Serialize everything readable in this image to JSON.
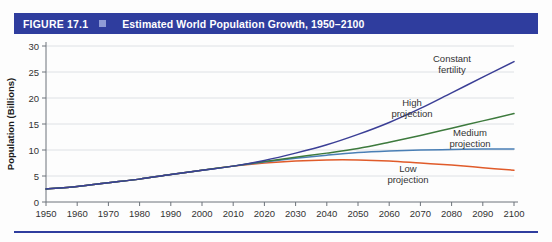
{
  "figure": {
    "number": "FIGURE 17.1",
    "marker_icon": "square-bullet-icon",
    "title": "Estimated World Population Growth, 1950–2100",
    "accent_color": "#2f3d9e"
  },
  "chart_data": {
    "type": "line",
    "title": "Estimated World Population Growth, 1950–2100",
    "xlabel": "",
    "ylabel": "Population (Billions)",
    "xlim": [
      1950,
      2100
    ],
    "ylim": [
      0,
      30
    ],
    "grid": true,
    "legend_position": "inline-annotations",
    "xticks": [
      1950,
      1960,
      1970,
      1980,
      1990,
      2000,
      2010,
      2020,
      2030,
      2040,
      2050,
      2060,
      2070,
      2080,
      2090,
      2100
    ],
    "yticks": [
      0,
      5,
      10,
      15,
      20,
      25,
      30
    ],
    "x": [
      1950,
      1960,
      1970,
      1980,
      1990,
      2000,
      2010,
      2020,
      2030,
      2040,
      2050,
      2060,
      2070,
      2080,
      2090,
      2100
    ],
    "series": [
      {
        "name": "Constant fertility",
        "color": "#3b3f96",
        "values": [
          2.5,
          3.0,
          3.7,
          4.4,
          5.3,
          6.1,
          6.9,
          8.0,
          9.4,
          11.0,
          13.0,
          15.3,
          18.0,
          21.0,
          24.0,
          27.0
        ]
      },
      {
        "name": "High projection",
        "color": "#4a7fb5",
        "values": [
          2.5,
          3.0,
          3.7,
          4.4,
          5.3,
          6.1,
          6.9,
          7.7,
          8.4,
          9.0,
          9.5,
          9.8,
          10.0,
          10.1,
          10.2,
          10.2
        ]
      },
      {
        "name": "Medium projection",
        "color": "#3d7a3d",
        "values": [
          2.5,
          3.0,
          3.7,
          4.4,
          5.3,
          6.1,
          6.9,
          7.8,
          8.6,
          9.4,
          10.3,
          11.5,
          12.8,
          14.2,
          15.6,
          17.0
        ]
      },
      {
        "name": "Low projection",
        "color": "#e05b2a",
        "values": [
          2.5,
          3.0,
          3.7,
          4.4,
          5.3,
          6.1,
          6.9,
          7.5,
          7.9,
          8.1,
          8.1,
          7.9,
          7.5,
          7.1,
          6.6,
          6.1
        ]
      }
    ],
    "annotations": [
      {
        "text_line1": "Constant",
        "text_line2": "fertility",
        "x_px": 452,
        "y_px": 62
      },
      {
        "text_line1": "High",
        "text_line2": "projection",
        "x_px": 412,
        "y_px": 106
      },
      {
        "text_line1": "Medium",
        "text_line2": "projection",
        "x_px": 470,
        "y_px": 136
      },
      {
        "text_line1": "Low",
        "text_line2": "projection",
        "x_px": 408,
        "y_px": 172
      }
    ]
  }
}
